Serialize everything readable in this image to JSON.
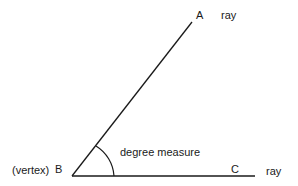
{
  "diagram": {
    "colors": {
      "stroke": "#1a1a1a",
      "text": "#1a1a1a",
      "background": "#ffffff"
    },
    "points": {
      "A": {
        "label": "A",
        "x": 192,
        "y": 22
      },
      "B": {
        "label": "B",
        "x": 72,
        "y": 176
      },
      "C": {
        "label": "C",
        "x": 255,
        "y": 176
      }
    },
    "labels": {
      "vertex": "(vertex)",
      "B": "B",
      "A": "A",
      "C": "C",
      "ray_top": "ray",
      "ray_bottom": "ray",
      "angle": "degree measure"
    }
  }
}
